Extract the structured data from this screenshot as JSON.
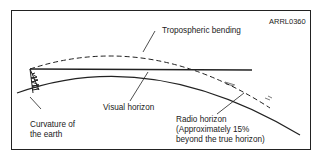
{
  "figure": {
    "id_label": "ARRL0360",
    "labels": {
      "tropospheric_bending": "Tropospheric bending",
      "visual_horizon": "Visual horizon",
      "curvature_line1": "Curvature of",
      "curvature_line2": "the earth",
      "radio_line1": "Radio horizon",
      "radio_line2": "(Approximately 15%",
      "radio_line3": "beyond the true horizon)"
    },
    "colors": {
      "line": "#222222",
      "background": "#ffffff"
    }
  }
}
